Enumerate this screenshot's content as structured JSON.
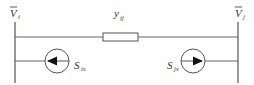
{
  "diagram": {
    "type": "circuit",
    "line_color": "#555555",
    "nodes": {
      "left_bus": {
        "label": "V",
        "subscript": "i",
        "overbar": true
      },
      "right_bus": {
        "label": "V",
        "subscript": "j",
        "overbar": true
      }
    },
    "branch": {
      "element": "admittance",
      "label": "y",
      "subscript": "ij"
    },
    "sources": [
      {
        "label": "S",
        "subscript": "is",
        "direction": "left",
        "at": "left_bus"
      },
      {
        "label": "S",
        "subscript": "js",
        "direction": "right",
        "at": "right_bus"
      }
    ]
  }
}
